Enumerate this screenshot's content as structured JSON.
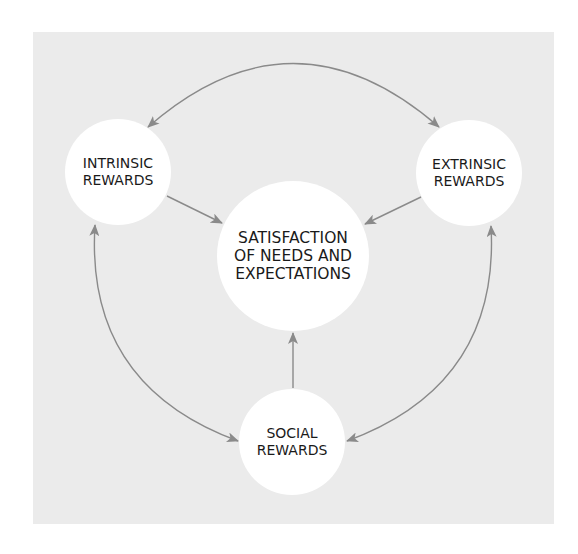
{
  "diagram": {
    "colors": {
      "page_background": "#ffffff",
      "panel_background": "#ebebeb",
      "node_fill": "#ffffff",
      "arrow": "#8a8a8a",
      "text": "#1a1a1a"
    },
    "nodes": {
      "intrinsic": {
        "lines": [
          "INTRINSIC",
          "REWARDS"
        ]
      },
      "extrinsic": {
        "lines": [
          "EXTRINSIC",
          "REWARDS"
        ]
      },
      "center": {
        "lines": [
          "SATISFACTION",
          "OF NEEDS AND",
          "EXPECTATIONS"
        ]
      },
      "social": {
        "lines": [
          "SOCIAL",
          "REWARDS"
        ]
      }
    },
    "edges": [
      {
        "from": "intrinsic",
        "to": "center",
        "type": "one-way"
      },
      {
        "from": "extrinsic",
        "to": "center",
        "type": "one-way"
      },
      {
        "from": "social",
        "to": "center",
        "type": "one-way"
      },
      {
        "from": "intrinsic",
        "to": "extrinsic",
        "type": "two-way"
      },
      {
        "from": "intrinsic",
        "to": "social",
        "type": "two-way"
      },
      {
        "from": "extrinsic",
        "to": "social",
        "type": "two-way"
      }
    ]
  }
}
